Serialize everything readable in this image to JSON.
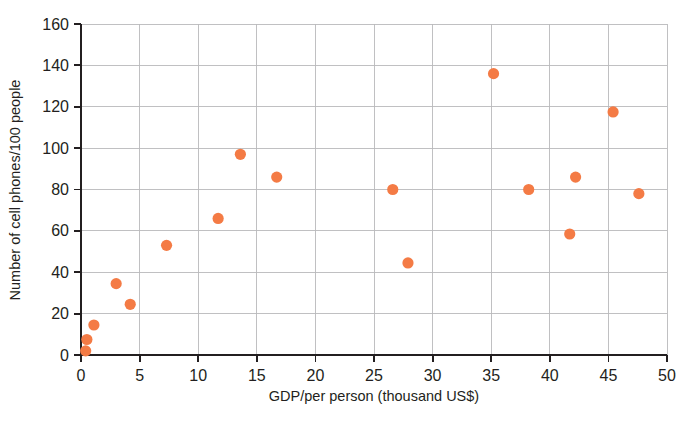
{
  "chart_data": {
    "type": "scatter",
    "title": "",
    "xlabel": "GDP/per person (thousand US$)",
    "ylabel": "Number of cell phones/100 people",
    "xlim": [
      0,
      50
    ],
    "ylim": [
      0,
      160
    ],
    "xticks": [
      0,
      5,
      10,
      15,
      20,
      25,
      30,
      35,
      40,
      45,
      50
    ],
    "yticks": [
      0,
      20,
      40,
      60,
      80,
      100,
      120,
      140,
      160
    ],
    "xtick_labels": [
      "0",
      "5",
      "10",
      "15",
      "20",
      "25",
      "30",
      "35",
      "40",
      "45",
      "50"
    ],
    "ytick_labels": [
      "0",
      "20",
      "40",
      "60",
      "80",
      "100",
      "120",
      "140",
      "160"
    ],
    "grid": true,
    "grid_axis": "y",
    "legend": false,
    "legend_position": "none",
    "marker_color": "#f47b45",
    "marker_size": 9,
    "points": [
      {
        "x": 0.4,
        "y": 2
      },
      {
        "x": 0.5,
        "y": 7.5
      },
      {
        "x": 1.1,
        "y": 14.5
      },
      {
        "x": 3.0,
        "y": 34.5
      },
      {
        "x": 4.2,
        "y": 24.5
      },
      {
        "x": 7.3,
        "y": 53
      },
      {
        "x": 11.7,
        "y": 66
      },
      {
        "x": 13.6,
        "y": 97
      },
      {
        "x": 16.7,
        "y": 86
      },
      {
        "x": 26.6,
        "y": 80
      },
      {
        "x": 27.9,
        "y": 44.5
      },
      {
        "x": 35.2,
        "y": 136
      },
      {
        "x": 38.2,
        "y": 80
      },
      {
        "x": 41.7,
        "y": 58.5
      },
      {
        "x": 42.2,
        "y": 86
      },
      {
        "x": 45.4,
        "y": 117.5
      },
      {
        "x": 47.6,
        "y": 78
      }
    ]
  },
  "colors": {
    "marker": "#f47b45",
    "grid": "#b9b9bb",
    "axis": "#231f20",
    "background": "#ffffff"
  }
}
